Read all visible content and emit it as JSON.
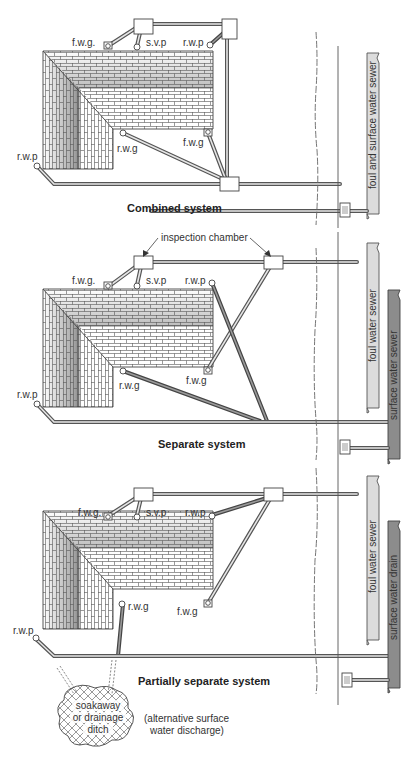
{
  "figure": {
    "colors": {
      "pipe_outline": "#555555",
      "pipe_fill": "#e6e6e6",
      "surface_sewer": "#8c8c8c",
      "foul_sewer": "#dcdcdc",
      "brick_light": "#ffffff",
      "brick_mid": "#d4d4d4",
      "brick_dark": "#9e9e9e",
      "mortar": "#555555"
    }
  },
  "panels": [
    {
      "title": "Combined system",
      "labels": {
        "fwg_top": "f.w.g.",
        "svp": "s.v.p",
        "rwp_top": "r.w.p",
        "rwp_left": "r.w.p",
        "rwg": "r.w.g",
        "fwg_bottom": "f.w.g"
      },
      "sewers": [
        {
          "label": "foul and surface water sewer",
          "shade": "light"
        }
      ]
    },
    {
      "title": "Separate system",
      "callout": "inspection chamber",
      "labels": {
        "fwg_top": "f.w.g.",
        "svp": "s.v.p",
        "rwp_top": "r.w.p",
        "rwp_left": "r.w.p",
        "rwg": "r.w.g",
        "fwg_bottom": "f.w.g"
      },
      "sewers": [
        {
          "label": "foul water sewer",
          "shade": "light"
        },
        {
          "label": "surface water sewer",
          "shade": "dark"
        }
      ]
    },
    {
      "title": "Partially separate system",
      "labels": {
        "fwg_top": "f.w.g.",
        "svp": "s.v.p",
        "rwp_top": "r.w.p",
        "rwp_left": "r.w.p",
        "rwg": "r.w.g",
        "fwg_bottom": "f.w.g"
      },
      "sewers": [
        {
          "label": "foul water sewer",
          "shade": "light"
        },
        {
          "label": "surface water drain",
          "shade": "dark"
        }
      ],
      "soakaway": {
        "line1": "soakaway",
        "line2": "or drainage",
        "line3": "ditch"
      },
      "note": {
        "line1": "(alternative surface",
        "line2": "water discharge)"
      }
    }
  ]
}
